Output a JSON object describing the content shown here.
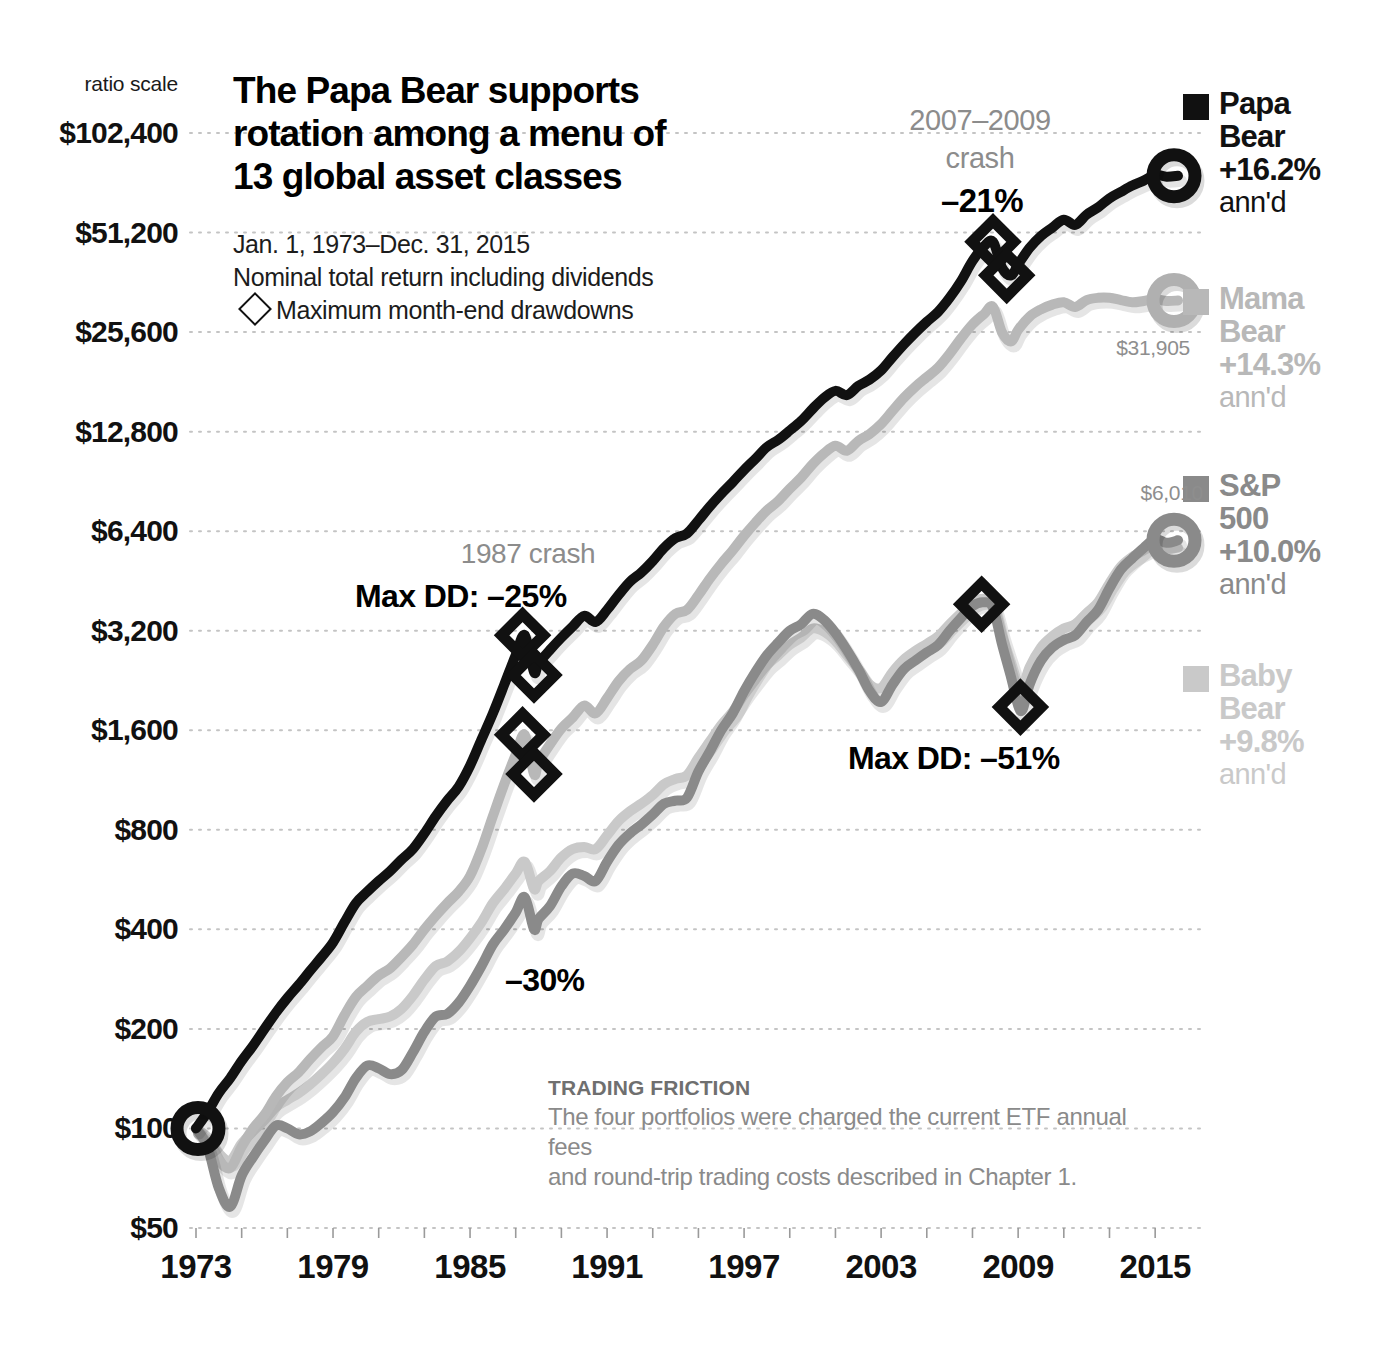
{
  "header": {
    "title_lines": [
      "The Papa Bear supports",
      "rotation among a menu of",
      "13 global asset classes"
    ],
    "subtitle_date": "Jan. 1, 1973–Dec. 31, 2015",
    "subtitle_basis": "Nominal total return including dividends",
    "subtitle_drawdown": "Maximum month-end drawdowns",
    "ratio_scale_label": "ratio scale"
  },
  "annotations": {
    "crash_1987": "1987 crash",
    "max_dd_papa": "Max DD: –25%",
    "crash_2007_title": "2007–2009",
    "crash_2007_sub": "crash",
    "crash_2007_pct": "–21%",
    "max_dd_sp": "Max DD: –51%",
    "dd_mama": "–30%"
  },
  "friction": {
    "heading": "TRADING FRICTION",
    "body_line1": "The four portfolios were charged the current ETF annual fees",
    "body_line2": "and round-trip trading costs described in Chapter 1."
  },
  "legend": [
    {
      "name_line1": "Papa",
      "name_line2": "Bear",
      "return": "+16.2%",
      "annd": "ann'd",
      "color": "#111111",
      "end_value": ""
    },
    {
      "name_line1": "Mama",
      "name_line2": "Bear",
      "return": "+14.3%",
      "annd": "ann'd",
      "color": "#b8b8b8",
      "end_value": "$31,905"
    },
    {
      "name_line1": "S&P",
      "name_line2": "500",
      "return": "+10.0%",
      "annd": "ann'd",
      "color": "#8a8a8a",
      "end_value": "$6,010"
    },
    {
      "name_line1": "Baby",
      "name_line2": "Bear",
      "return": "+9.8%",
      "annd": "ann'd",
      "color": "#c9c9c9",
      "end_value": ""
    }
  ],
  "chart_data": {
    "type": "line",
    "title": "The Papa Bear supports rotation among a menu of 13 global asset classes",
    "subtitle": "Jan. 1, 1973–Dec. 31, 2015 — Nominal total return including dividends",
    "xlabel": "",
    "ylabel": "",
    "yscale": "log",
    "ylim": [
      50,
      102400
    ],
    "xlim": [
      1973,
      2016
    ],
    "grid": "horizontal-dotted",
    "legend_position": "right",
    "ytick_labels": [
      "$102,400",
      "$51,200",
      "$25,600",
      "$12,800",
      "$6,400",
      "$3,200",
      "$1,600",
      "$800",
      "$400",
      "$200",
      "$100",
      "$50"
    ],
    "ytick_values": [
      102400,
      51200,
      25600,
      12800,
      6400,
      3200,
      1600,
      800,
      400,
      200,
      100,
      50
    ],
    "xtick_labels": [
      "1973",
      "1979",
      "1985",
      "1991",
      "1997",
      "2003",
      "2009",
      "2015"
    ],
    "xtick_values": [
      1973,
      1979,
      1985,
      1991,
      1997,
      2003,
      2009,
      2015
    ],
    "start_value": 100,
    "annotations": [
      {
        "text": "1987 crash",
        "x": 1987,
        "y": 4200
      },
      {
        "text": "Max DD: –25%",
        "x": 1984.5,
        "y": 4100
      },
      {
        "text": "2007–2009 crash",
        "x": 2007,
        "y": 80000
      },
      {
        "text": "–21%",
        "x": 2007,
        "y": 55000
      },
      {
        "text": "Max DD: –51%",
        "x": 2004,
        "y": 1300
      },
      {
        "text": "–30%",
        "x": 1987.5,
        "y": 290
      }
    ],
    "series": [
      {
        "name": "Papa Bear",
        "color": "#111111",
        "annualized_return": 16.2,
        "max_drawdown_pct": -25,
        "drawdown_2007_2009_pct": -21,
        "final_value": 76000,
        "x": [
          1973.0,
          1973.5,
          1974.0,
          1974.5,
          1975.0,
          1975.5,
          1976.0,
          1976.5,
          1977.0,
          1977.5,
          1978.0,
          1978.5,
          1979.0,
          1979.5,
          1980.0,
          1980.5,
          1981.0,
          1981.5,
          1982.0,
          1982.5,
          1983.0,
          1983.5,
          1984.0,
          1984.5,
          1985.0,
          1985.5,
          1986.0,
          1986.5,
          1987.0,
          1987.4,
          1987.8,
          1988.0,
          1988.5,
          1989.0,
          1989.5,
          1990.0,
          1990.5,
          1991.0,
          1991.5,
          1992.0,
          1992.5,
          1993.0,
          1993.5,
          1994.0,
          1994.5,
          1995.0,
          1995.5,
          1996.0,
          1996.5,
          1997.0,
          1997.5,
          1998.0,
          1998.5,
          1999.0,
          1999.5,
          2000.0,
          2000.5,
          2001.0,
          2001.5,
          2002.0,
          2002.5,
          2003.0,
          2003.5,
          2004.0,
          2004.5,
          2005.0,
          2005.5,
          2006.0,
          2006.5,
          2007.0,
          2007.5,
          2007.9,
          2008.3,
          2008.7,
          2009.0,
          2009.5,
          2010.0,
          2010.5,
          2011.0,
          2011.5,
          2012.0,
          2012.5,
          2013.0,
          2013.5,
          2014.0,
          2014.5,
          2015.0,
          2015.5,
          2016.0
        ],
        "y": [
          100,
          112,
          128,
          142,
          160,
          178,
          200,
          224,
          248,
          272,
          300,
          330,
          365,
          420,
          480,
          520,
          560,
          600,
          650,
          700,
          780,
          880,
          980,
          1080,
          1250,
          1500,
          1800,
          2200,
          2700,
          3100,
          2400,
          2550,
          2800,
          3050,
          3300,
          3550,
          3400,
          3700,
          4100,
          4500,
          4800,
          5200,
          5700,
          6100,
          6300,
          6900,
          7600,
          8300,
          9000,
          9800,
          10600,
          11500,
          12100,
          12900,
          13800,
          15000,
          16200,
          17000,
          16500,
          17600,
          18400,
          19600,
          21500,
          23500,
          25500,
          27500,
          29500,
          32500,
          36500,
          42000,
          46500,
          48000,
          40000,
          38000,
          41000,
          46000,
          50000,
          53000,
          56000,
          54000,
          58000,
          61000,
          65000,
          68000,
          71000,
          73500,
          76500,
          75500,
          76000
        ]
      },
      {
        "name": "Mama Bear",
        "color": "#b8b8b8",
        "annualized_return": 14.3,
        "max_drawdown_pct": -30,
        "final_value": 31905,
        "x": [
          1973.0,
          1973.5,
          1974.0,
          1974.5,
          1975.0,
          1975.5,
          1976.0,
          1976.5,
          1977.0,
          1977.5,
          1978.0,
          1978.5,
          1979.0,
          1979.5,
          1980.0,
          1980.5,
          1981.0,
          1981.5,
          1982.0,
          1982.5,
          1983.0,
          1983.5,
          1984.0,
          1984.5,
          1985.0,
          1985.5,
          1986.0,
          1986.5,
          1987.0,
          1987.4,
          1987.8,
          1988.0,
          1988.5,
          1989.0,
          1989.5,
          1990.0,
          1990.5,
          1991.0,
          1991.5,
          1992.0,
          1992.5,
          1993.0,
          1993.5,
          1994.0,
          1994.5,
          1995.0,
          1995.5,
          1996.0,
          1996.5,
          1997.0,
          1997.5,
          1998.0,
          1998.5,
          1999.0,
          1999.5,
          2000.0,
          2000.5,
          2001.0,
          2001.5,
          2002.0,
          2002.5,
          2003.0,
          2003.5,
          2004.0,
          2004.5,
          2005.0,
          2005.5,
          2006.0,
          2006.5,
          2007.0,
          2007.5,
          2007.9,
          2008.3,
          2008.7,
          2009.0,
          2009.5,
          2010.0,
          2010.5,
          2011.0,
          2011.5,
          2012.0,
          2012.5,
          2013.0,
          2013.5,
          2014.0,
          2014.5,
          2015.0,
          2015.5,
          2016.0
        ],
        "y": [
          100,
          92,
          80,
          76,
          88,
          100,
          110,
          125,
          138,
          148,
          162,
          176,
          190,
          220,
          250,
          270,
          290,
          305,
          330,
          360,
          400,
          440,
          480,
          520,
          580,
          700,
          880,
          1100,
          1350,
          1550,
          1180,
          1280,
          1450,
          1620,
          1750,
          1900,
          1800,
          2000,
          2250,
          2450,
          2600,
          2900,
          3300,
          3600,
          3700,
          4100,
          4600,
          5100,
          5600,
          6200,
          6800,
          7400,
          7900,
          8600,
          9300,
          10200,
          11000,
          11600,
          11200,
          12000,
          12600,
          13500,
          14800,
          16200,
          17500,
          18700,
          20000,
          22000,
          24500,
          27000,
          29000,
          30500,
          25500,
          24000,
          26000,
          28500,
          30000,
          31000,
          31500,
          30500,
          32000,
          32500,
          32500,
          32000,
          31500,
          31800,
          32200,
          31800,
          31905
        ]
      },
      {
        "name": "S&P 500",
        "color": "#8a8a8a",
        "annualized_return": 10.0,
        "max_drawdown_pct": -51,
        "final_value": 6010,
        "x": [
          1973.0,
          1973.5,
          1974.0,
          1974.5,
          1975.0,
          1975.5,
          1976.0,
          1976.5,
          1977.0,
          1977.5,
          1978.0,
          1978.5,
          1979.0,
          1979.5,
          1980.0,
          1980.5,
          1981.0,
          1981.5,
          1982.0,
          1982.5,
          1983.0,
          1983.5,
          1984.0,
          1984.5,
          1985.0,
          1985.5,
          1986.0,
          1986.5,
          1987.0,
          1987.4,
          1987.8,
          1988.0,
          1988.5,
          1989.0,
          1989.5,
          1990.0,
          1990.5,
          1991.0,
          1991.5,
          1992.0,
          1992.5,
          1993.0,
          1993.5,
          1994.0,
          1994.5,
          1995.0,
          1995.5,
          1996.0,
          1996.5,
          1997.0,
          1997.5,
          1998.0,
          1998.5,
          1999.0,
          1999.5,
          2000.0,
          2000.5,
          2001.0,
          2001.5,
          2002.0,
          2002.5,
          2003.0,
          2003.5,
          2004.0,
          2004.5,
          2005.0,
          2005.5,
          2006.0,
          2006.5,
          2007.0,
          2007.5,
          2007.9,
          2008.3,
          2008.7,
          2009.0,
          2009.2,
          2009.5,
          2010.0,
          2010.5,
          2011.0,
          2011.5,
          2012.0,
          2012.5,
          2013.0,
          2013.5,
          2014.0,
          2014.5,
          2015.0,
          2015.5,
          2016.0
        ],
        "y": [
          100,
          88,
          66,
          58,
          72,
          82,
          92,
          102,
          100,
          96,
          98,
          104,
          112,
          124,
          142,
          155,
          152,
          146,
          150,
          170,
          196,
          218,
          222,
          240,
          270,
          310,
          360,
          400,
          450,
          500,
          400,
          430,
          470,
          540,
          590,
          580,
          560,
          640,
          720,
          780,
          830,
          890,
          960,
          980,
          1000,
          1200,
          1380,
          1600,
          1800,
          2100,
          2400,
          2700,
          2950,
          3200,
          3350,
          3600,
          3450,
          3150,
          2800,
          2450,
          2100,
          1950,
          2200,
          2450,
          2600,
          2750,
          2900,
          3200,
          3500,
          3800,
          3900,
          3750,
          2900,
          2300,
          1900,
          1850,
          2200,
          2600,
          2850,
          3000,
          3100,
          3400,
          3700,
          4300,
          4900,
          5300,
          5700,
          6050,
          5900,
          6010
        ]
      },
      {
        "name": "Baby Bear",
        "color": "#c9c9c9",
        "annualized_return": 9.8,
        "final_value": 5700,
        "x": [
          1973.0,
          1973.5,
          1974.0,
          1974.5,
          1975.0,
          1975.5,
          1976.0,
          1976.5,
          1977.0,
          1977.5,
          1978.0,
          1978.5,
          1979.0,
          1979.5,
          1980.0,
          1980.5,
          1981.0,
          1981.5,
          1982.0,
          1982.5,
          1983.0,
          1983.5,
          1984.0,
          1984.5,
          1985.0,
          1985.5,
          1986.0,
          1986.5,
          1987.0,
          1987.4,
          1987.8,
          1988.0,
          1988.5,
          1989.0,
          1989.5,
          1990.0,
          1990.5,
          1991.0,
          1991.5,
          1992.0,
          1992.5,
          1993.0,
          1993.5,
          1994.0,
          1994.5,
          1995.0,
          1995.5,
          1996.0,
          1996.5,
          1997.0,
          1997.5,
          1998.0,
          1998.5,
          1999.0,
          1999.5,
          2000.0,
          2000.5,
          2001.0,
          2001.5,
          2002.0,
          2002.5,
          2003.0,
          2003.5,
          2004.0,
          2004.5,
          2005.0,
          2005.5,
          2006.0,
          2006.5,
          2007.0,
          2007.5,
          2007.9,
          2008.3,
          2008.7,
          2009.0,
          2009.2,
          2009.5,
          2010.0,
          2010.5,
          2011.0,
          2011.5,
          2012.0,
          2012.5,
          2013.0,
          2013.5,
          2014.0,
          2014.5,
          2015.0,
          2015.5,
          2016.0
        ],
        "y": [
          100,
          94,
          84,
          80,
          90,
          98,
          106,
          116,
          122,
          128,
          136,
          146,
          158,
          174,
          196,
          210,
          214,
          218,
          230,
          252,
          282,
          310,
          320,
          342,
          376,
          420,
          480,
          530,
          590,
          640,
          530,
          560,
          600,
          660,
          700,
          710,
          700,
          770,
          850,
          910,
          960,
          1020,
          1100,
          1140,
          1170,
          1320,
          1480,
          1660,
          1820,
          2050,
          2280,
          2520,
          2700,
          2900,
          3050,
          3250,
          3180,
          2980,
          2700,
          2450,
          2200,
          2150,
          2400,
          2620,
          2780,
          2920,
          3080,
          3350,
          3620,
          3900,
          4000,
          3880,
          3100,
          2550,
          2200,
          2150,
          2480,
          2850,
          3080,
          3250,
          3350,
          3620,
          3900,
          4450,
          5000,
          5350,
          5600,
          5800,
          5650,
          5700
        ]
      }
    ],
    "drawdown_markers": [
      {
        "series": "Papa Bear",
        "label": "1987 peak",
        "x": 1987.3,
        "y": 3100
      },
      {
        "series": "Papa Bear",
        "label": "1987 trough",
        "x": 1987.8,
        "y": 2350
      },
      {
        "series": "Papa Bear",
        "label": "2007 peak",
        "x": 2007.9,
        "y": 48000
      },
      {
        "series": "Papa Bear",
        "label": "2009 trough",
        "x": 2008.5,
        "y": 38000
      },
      {
        "series": "S&P 500",
        "label": "2007 peak",
        "x": 2007.4,
        "y": 3850
      },
      {
        "series": "S&P 500",
        "label": "2009 trough",
        "x": 2009.1,
        "y": 1880
      },
      {
        "series": "Mama Bear",
        "label": "1987 peak",
        "x": 1987.3,
        "y": 1550
      },
      {
        "series": "Mama Bear",
        "label": "1987 trough",
        "x": 1987.8,
        "y": 1180
      }
    ]
  }
}
